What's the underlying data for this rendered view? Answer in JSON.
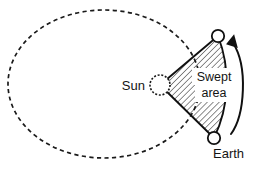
{
  "diagram": {
    "labels": {
      "sun": "Sun",
      "earth": "Earth",
      "swept_line1": "Swept",
      "swept_line2": "area"
    },
    "colors": {
      "ink": "#101010",
      "orbit_stroke": "#1a1a1a",
      "hatch": "#1a1a1a",
      "background": "#ffffff"
    },
    "geometry": {
      "orbit": {
        "center_x": 104,
        "center_y": 84,
        "radius_x": 96,
        "radius_y": 74,
        "style": "dashed-ellipse"
      },
      "sun": {
        "center_x": 160,
        "center_y": 85,
        "radius": 10,
        "style": "dashed-circle"
      },
      "earth": {
        "center_x": 214,
        "center_y": 138,
        "radius": 6.2,
        "style": "solid-circle"
      },
      "orbit_point_upper": {
        "center_x": 218,
        "center_y": 36,
        "radius": 6.2,
        "style": "solid-circle"
      },
      "swept_sector": {
        "hatch_angle_deg": 45,
        "hatch_spacing_px": 4.2,
        "description": "triangular sector from Sun to two orbit positions with arc outer edge"
      },
      "motion_arrow": {
        "direction": "counterclockwise",
        "from_x": 233,
        "from_y": 133,
        "to_x": 232,
        "to_y": 40
      }
    }
  }
}
